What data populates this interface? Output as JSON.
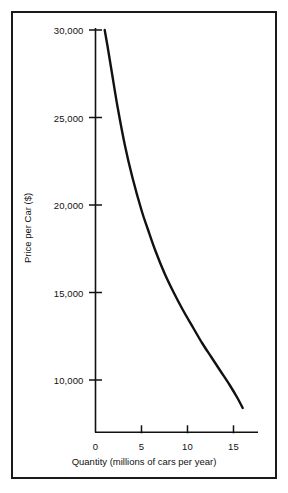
{
  "chart_data": {
    "type": "line",
    "title": "",
    "subtitle": "",
    "xlabel": "Quantity (millions of cars per year)",
    "ylabel": "Price per Car ($)",
    "xlim": [
      0,
      17.5
    ],
    "ylim": [
      7000,
      30500
    ],
    "grid": false,
    "legend": null,
    "annotations": [],
    "x_ticks": [
      {
        "value": 0,
        "label": "0"
      },
      {
        "value": 5,
        "label": "5"
      },
      {
        "value": 10,
        "label": "10"
      },
      {
        "value": 15,
        "label": "15"
      }
    ],
    "y_ticks": [
      {
        "value": 10000,
        "label": "10,000"
      },
      {
        "value": 15000,
        "label": "15,000"
      },
      {
        "value": 20000,
        "label": "20,000"
      },
      {
        "value": 25000,
        "label": "25,000"
      },
      {
        "value": 30000,
        "label": "30,000"
      }
    ],
    "series": [
      {
        "name": "Demand curve",
        "color": "#111111",
        "x": [
          1.0,
          1.3,
          1.8,
          2.4,
          3.2,
          4.0,
          5.0,
          5.7,
          6.5,
          7.5,
          8.5,
          9.5,
          10.6,
          11.6,
          12.6,
          13.6,
          14.6,
          15.4,
          16.0
        ],
        "y": [
          30000,
          29100,
          27500,
          25600,
          23400,
          21600,
          19700,
          18600,
          17400,
          16100,
          15000,
          14000,
          13000,
          12100,
          11300,
          10500,
          9700,
          9000,
          8400
        ]
      }
    ]
  },
  "figure": {
    "border_color": "#1a1a1a",
    "axis_color": "#111111",
    "background": "#ffffff"
  }
}
